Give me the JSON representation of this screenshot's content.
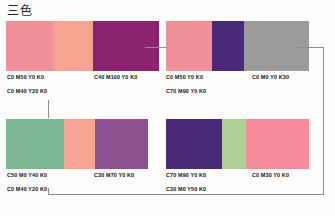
{
  "page": {
    "title": "三色",
    "background": "#fdfdfb",
    "line_color": "#8d8d8d"
  },
  "groups": [
    {
      "id": "group-top-left",
      "name": "top-left",
      "swatches": [
        {
          "name": "pink",
          "color": "#f0909a",
          "width": 47
        },
        {
          "name": "salmon",
          "color": "#f4a490",
          "width": 40
        },
        {
          "name": "magenta",
          "color": "#8b2272",
          "width": 66
        }
      ],
      "labels": [
        {
          "name": "label-c0-m50-y0-k0",
          "text": "C0  M50  Y0  K0"
        },
        {
          "name": "label-c0-m40-y20-k0",
          "text": "C0  M40  Y20  K0"
        },
        {
          "name": "label-c40-m100-y0-k0",
          "text": "C40  M100  Y0  K0"
        }
      ]
    },
    {
      "id": "group-top-right",
      "name": "top-right",
      "swatches": [
        {
          "name": "pink",
          "color": "#f0909a",
          "width": 46
        },
        {
          "name": "violet",
          "color": "#4a2a78",
          "width": 32
        },
        {
          "name": "gray",
          "color": "#9a9a9a",
          "width": 65
        }
      ],
      "labels": [
        {
          "name": "label-c0-m50-y0-k0",
          "text": "C0  M50  Y0  K0"
        },
        {
          "name": "label-c70-m90-y0-k0",
          "text": "C70  M90  Y0  K0"
        },
        {
          "name": "label-c0-m0-y0-k30",
          "text": "C0  M0  Y0  K30"
        }
      ]
    },
    {
      "id": "group-bottom-left",
      "name": "bottom-left",
      "swatches": [
        {
          "name": "green",
          "color": "#7cb894",
          "width": 58
        },
        {
          "name": "salmon",
          "color": "#f4a490",
          "width": 31
        },
        {
          "name": "purple",
          "color": "#8b5090",
          "width": 53
        }
      ],
      "labels": [
        {
          "name": "label-c50-m0-y40-k0",
          "text": "C50  M0  Y40  K0"
        },
        {
          "name": "label-c0-m40-y20-k0",
          "text": "C0  M40  Y20  K0"
        },
        {
          "name": "label-c30-m70-y0-k0",
          "text": "C30  M70  Y0  K0"
        }
      ]
    },
    {
      "id": "group-bottom-right",
      "name": "bottom-right",
      "swatches": [
        {
          "name": "violet",
          "color": "#4a2a78",
          "width": 56
        },
        {
          "name": "light-green",
          "color": "#aecf92",
          "width": 24
        },
        {
          "name": "pink",
          "color": "#f68a9a",
          "width": 63
        }
      ],
      "labels": [
        {
          "name": "label-c70-m90-y0-k0",
          "text": "C70  M90  Y0  K0"
        },
        {
          "name": "label-c30-m0-y50-k0",
          "text": "C30  M0  Y50  K0"
        },
        {
          "name": "label-c0-m30-y0-k0",
          "text": "C0  M30  Y0  K0"
        }
      ]
    }
  ]
}
